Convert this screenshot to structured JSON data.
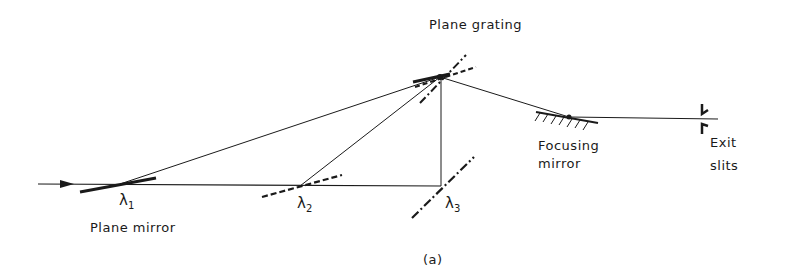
{
  "diagram": {
    "labels": {
      "plane_grating": "Plane grating",
      "focusing_mirror_line1": "Focusing",
      "focusing_mirror_line2": "mirror",
      "exit_slits_line1": "Exit",
      "exit_slits_line2": "slits",
      "plane_mirror": "Plane mirror",
      "caption": "(a)"
    },
    "wavelengths": [
      {
        "symbol": "λ",
        "sub": "1"
      },
      {
        "symbol": "λ",
        "sub": "2"
      },
      {
        "symbol": "λ",
        "sub": "3"
      }
    ],
    "colors": {
      "line": "#1a1a1a",
      "background": "#ffffff"
    }
  }
}
